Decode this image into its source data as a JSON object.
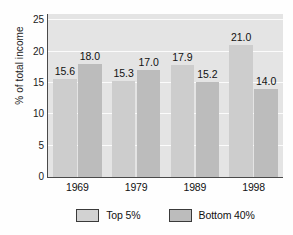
{
  "chart_data": {
    "type": "bar",
    "title": "",
    "xlabel": "",
    "ylabel": "% of total income",
    "categories": [
      "1969",
      "1979",
      "1989",
      "1998"
    ],
    "series": [
      {
        "name": "Top 5%",
        "values": [
          15.6,
          15.3,
          17.9,
          21.0
        ],
        "labels": [
          "15.6",
          "15.3",
          "17.9",
          "21.0"
        ],
        "color": "#cdcdcd"
      },
      {
        "name": "Bottom 40%",
        "values": [
          18.0,
          17.0,
          15.2,
          14.0
        ],
        "labels": [
          "18.0",
          "17.0",
          "15.2",
          "14.0"
        ],
        "color": "#bcbcbc"
      }
    ],
    "ylim": [
      0,
      26
    ],
    "yticks": [
      0,
      5,
      10,
      15,
      20,
      25
    ],
    "ytick_labels": [
      "0",
      "5",
      "10",
      "15",
      "20",
      "25"
    ],
    "grid": true,
    "grid_axis": "y",
    "legend_position": "bottom",
    "plot_background": "#e4e4e4",
    "gridline_color": "#fbfbfb",
    "axis_color": "#4a4a4a"
  }
}
